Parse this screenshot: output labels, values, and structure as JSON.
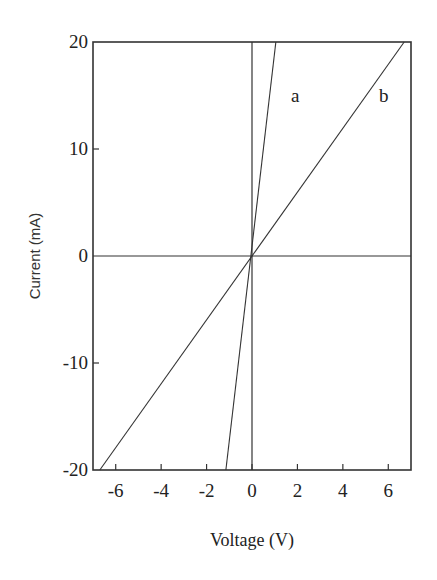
{
  "chart_data": {
    "type": "line",
    "title": "",
    "xlabel": "Voltage (V)",
    "ylabel": "Current (mA)",
    "xlim": [
      -7,
      7
    ],
    "ylim": [
      -20,
      20
    ],
    "xticks": [
      -6,
      -4,
      -2,
      0,
      2,
      4,
      6
    ],
    "xtick_labels": [
      "-6",
      "-4",
      "-2",
      "0",
      "2",
      "4",
      "6"
    ],
    "yticks": [
      -20,
      -10,
      0,
      10,
      20
    ],
    "ytick_labels": [
      "-20",
      "-10",
      "0",
      "10",
      "20"
    ],
    "grid": false,
    "reference_lines": [
      {
        "orientation": "horizontal",
        "value": 0
      },
      {
        "orientation": "vertical",
        "value": 0
      }
    ],
    "series": [
      {
        "name": "a",
        "x": [
          -1.15,
          1.05
        ],
        "y": [
          -20,
          20
        ]
      },
      {
        "name": "b",
        "x": [
          -6.7,
          6.7
        ],
        "y": [
          -20,
          20
        ]
      }
    ],
    "annotations": [
      {
        "text": "a",
        "x": 1.9,
        "y": 15
      },
      {
        "text": "b",
        "x": 5.8,
        "y": 15
      }
    ]
  }
}
